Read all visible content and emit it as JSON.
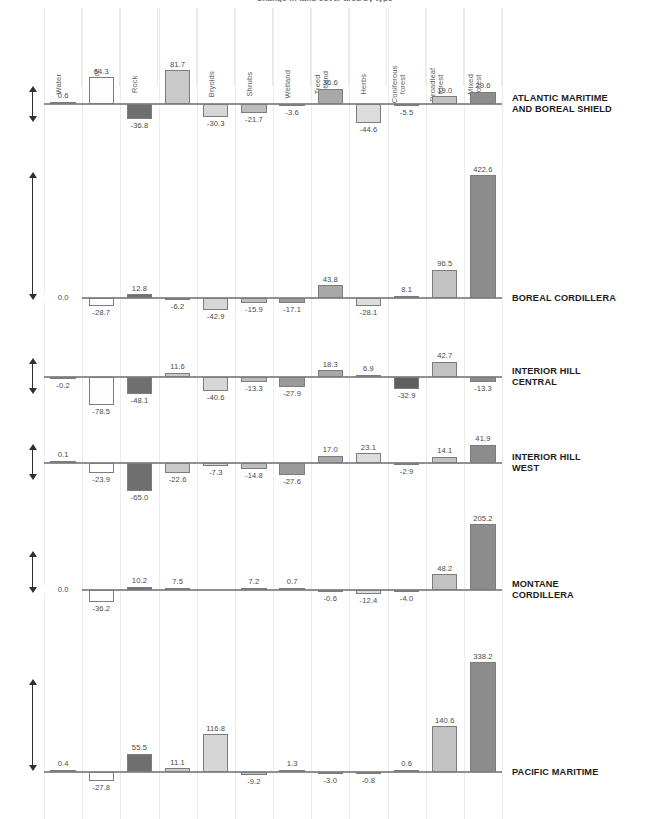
{
  "chart_data": {
    "type": "bar",
    "title": "Change in land cover area by type",
    "xlabel": "",
    "ylabel": "",
    "grid": true,
    "legend_position": "none",
    "zero_axis_label": "0.0",
    "axis_up_hint": "increase",
    "axis_down_hint": "decrease",
    "categories": [
      "Water",
      "Snow/ice",
      "Rock",
      "Barren",
      "Bryoids",
      "Shrubs",
      "Wetland",
      "Treed wetland",
      "Herbs",
      "Coniferous forest",
      "Broadleaf forest",
      "Mixed forest"
    ],
    "series": [
      {
        "name": "ATLANTIC MARITIME AND BOREAL SHIELD",
        "ylim": [
          -44.6,
          81.7
        ],
        "values": [
          0.6,
          64.3,
          -36.8,
          81.7,
          -30.3,
          -21.7,
          -3.6,
          36.6,
          -44.6,
          -5.5,
          19.0,
          29.6
        ],
        "labels": [
          "0.6",
          "64.3",
          "-36.8",
          "81.7",
          "-30.3",
          "-21.7",
          "-3.6",
          "36.6",
          "-44.6",
          "-5.5",
          "19.0",
          "29.6"
        ]
      },
      {
        "name": "BOREAL CORDILLERA",
        "ylim": [
          -42.9,
          422.6
        ],
        "values": [
          0.0,
          -28.7,
          12.8,
          -6.2,
          -42.9,
          -15.9,
          -17.1,
          43.8,
          -28.1,
          8.1,
          96.5,
          422.6
        ],
        "labels": [
          "0.0",
          "-28.7",
          "12.8",
          "-6.2",
          "-42.9",
          "-15.9",
          "-17.1",
          "43.8",
          "-28.1",
          "8.1",
          "96.5",
          "422.6"
        ]
      },
      {
        "name": "INTERIOR HILL CENTRAL",
        "ylim": [
          -78.5,
          42.7
        ],
        "values": [
          -0.2,
          -78.5,
          -48.1,
          11.6,
          -40.6,
          -13.3,
          -27.9,
          18.3,
          6.9,
          -32.9,
          42.7,
          -13.3
        ],
        "labels": [
          "-0.2",
          "-78.5",
          "-48.1",
          "11.6",
          "-40.6",
          "-13.3",
          "-27.9",
          "18.3",
          "6.9",
          "-32.9",
          "42.7",
          "-13.3"
        ]
      },
      {
        "name": "INTERIOR HILL WEST",
        "ylim": [
          -65.0,
          41.9
        ],
        "values": [
          0.1,
          -23.9,
          -65.0,
          -22.6,
          -7.3,
          -14.8,
          -27.6,
          17.0,
          23.1,
          -2.9,
          14.1,
          41.9
        ],
        "labels": [
          "0.1",
          "-23.9",
          "-65.0",
          "-22.6",
          "-7.3",
          "-14.8",
          "-27.6",
          "17.0",
          "23.1",
          "-2.9",
          "14.1",
          "41.9"
        ]
      },
      {
        "name": "MONTANE CORDILLERA",
        "ylim": [
          -36.2,
          205.2
        ],
        "values": [
          0.0,
          -36.2,
          10.2,
          7.5,
          null,
          7.2,
          0.7,
          -0.6,
          -12.4,
          -4.0,
          48.2,
          205.2
        ],
        "labels": [
          "0.0",
          "-36.2",
          "10.2",
          "7.5",
          "",
          "7.2",
          "0.7",
          "-0.6",
          "-12.4",
          "-4.0",
          "48.2",
          "205.2"
        ]
      },
      {
        "name": "PACIFIC MARITIME",
        "ylim": [
          -27.8,
          338.2
        ],
        "values": [
          0.4,
          -27.8,
          55.5,
          11.1,
          116.8,
          -9.2,
          1.3,
          -3.0,
          -0.8,
          0.6,
          140.6,
          338.2
        ],
        "labels": [
          "0.4",
          "-27.8",
          "55.5",
          "11.1",
          "116.8",
          "-9.2",
          "1.3",
          "-3.0",
          "-0.8",
          "0.6",
          "140.6",
          "338.2"
        ]
      }
    ],
    "region_label_lines": [
      [
        "ATLANTIC MARITIME",
        "AND BOREAL SHIELD"
      ],
      [
        "BOREAL CORDILLERA"
      ],
      [
        "INTERIOR HILL",
        "CENTRAL"
      ],
      [
        "INTERIOR HILL",
        "WEST"
      ],
      [
        "MONTANE",
        "CORDILLERA"
      ],
      [
        "PACIFIC MARITIME"
      ]
    ],
    "bar_colors": [
      "#f7f7f7",
      "#fdfdfd",
      "#6f6f6f",
      "#c9c9c9",
      "#d6d6d6",
      "#bdbdbd",
      "#9a9a9a",
      "#a8a8a8",
      "#dcdcdc",
      "#5f5f5f",
      "#c2c2c2",
      "#8c8c8c"
    ],
    "colors": {
      "baseline": "#8f8f95",
      "gridline": "#ececec",
      "bar_border": "#7c7c7c",
      "value_text": "#4a4a4a",
      "region_text": "#1c1c1c",
      "category_text": "#5d5d5d"
    }
  }
}
